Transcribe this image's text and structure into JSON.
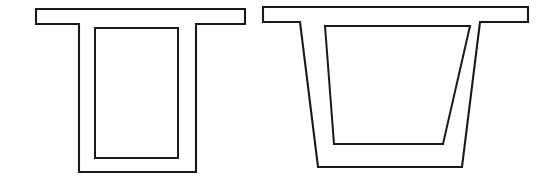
{
  "page": {
    "background_color": "#ffffff",
    "width": 553,
    "height": 189
  },
  "style": {
    "line_color": "#1a1a1a",
    "fill_color": "#ffffff",
    "outer_stroke_width": 2.1,
    "inner_stroke_width": 2.0
  },
  "figures": [
    {
      "id": "left-girder",
      "name": "rectangular-box-girder",
      "web_type": "vertical",
      "outline_points": "36,9 245,9 245,24 196,24 196,172 79,172 79,24 36,24",
      "cavity_points": "95,28 178,28 178,158 95,158",
      "geometry": {
        "flange_left_x": 36,
        "flange_right_x": 245,
        "flange_top_y": 9,
        "flange_bottom_y": 24,
        "web_outer_left_x": 79,
        "web_outer_right_x": 196,
        "web_inner_left_x": 95,
        "web_inner_right_x": 178,
        "bottom_outer_y": 172,
        "bottom_inner_y": 158,
        "cavity_top_y": 28
      }
    },
    {
      "id": "right-girder",
      "name": "trapezoidal-box-girder",
      "web_type": "inclined",
      "outline_points": "263,7 528,7 528,22 480,22 462,167 318,167 300,22 263,22",
      "cavity_points": "325,26 470,26 443,144 334,144",
      "geometry": {
        "flange_left_x": 263,
        "flange_right_x": 528,
        "flange_top_y": 7,
        "flange_bottom_y": 22,
        "web_outer_left_top_x": 300,
        "web_outer_left_bottom_x": 318,
        "web_outer_right_top_x": 480,
        "web_outer_right_bottom_x": 462,
        "web_inner_left_top_x": 325,
        "web_inner_left_bottom_x": 334,
        "web_inner_right_top_x": 470,
        "web_inner_right_bottom_x": 443,
        "bottom_outer_y": 167,
        "bottom_inner_y": 144,
        "cavity_top_y": 26
      }
    }
  ]
}
